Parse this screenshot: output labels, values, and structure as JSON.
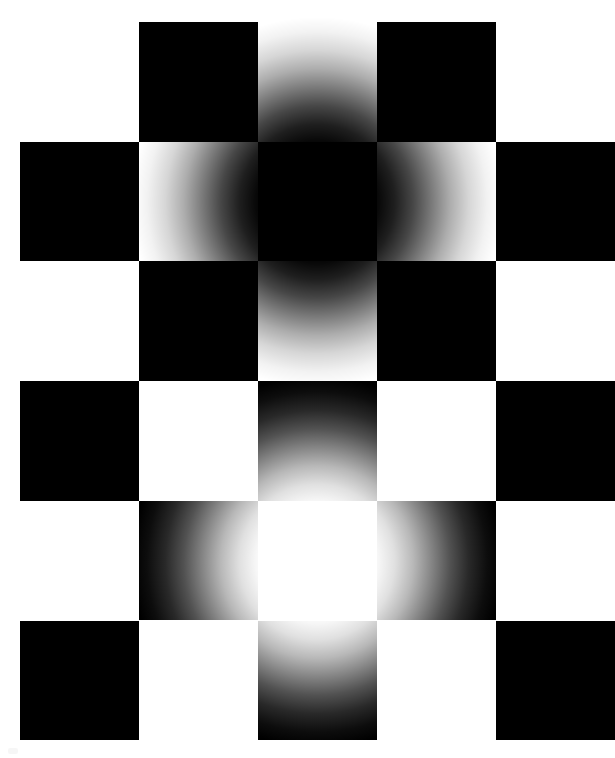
{
  "figure": {
    "name": "checkerboard-glow-illusion",
    "canvas": {
      "width": 615,
      "height": 758,
      "background": "#ffffff"
    }
  },
  "palette": {
    "square_dark": "#000000",
    "square_light": "#ffffff",
    "page_background": "#ffffff",
    "glow_dark_center": "#000000",
    "glow_light_center": "#ffffff"
  },
  "grid": {
    "origin_x": 20,
    "origin_y": 22,
    "columns": 5,
    "rows": 6,
    "cell_width": 119,
    "cell_height": 119.7,
    "pattern_note": "dark squares where (row + column) is even",
    "cells": [
      {
        "row": 0,
        "col": 0,
        "fill": "light"
      },
      {
        "row": 0,
        "col": 1,
        "fill": "dark"
      },
      {
        "row": 0,
        "col": 2,
        "fill": "light"
      },
      {
        "row": 0,
        "col": 3,
        "fill": "dark"
      },
      {
        "row": 0,
        "col": 4,
        "fill": "light"
      },
      {
        "row": 1,
        "col": 0,
        "fill": "dark"
      },
      {
        "row": 1,
        "col": 1,
        "fill": "light"
      },
      {
        "row": 1,
        "col": 2,
        "fill": "dark"
      },
      {
        "row": 1,
        "col": 3,
        "fill": "light"
      },
      {
        "row": 1,
        "col": 4,
        "fill": "dark"
      },
      {
        "row": 2,
        "col": 0,
        "fill": "light"
      },
      {
        "row": 2,
        "col": 1,
        "fill": "dark"
      },
      {
        "row": 2,
        "col": 2,
        "fill": "light"
      },
      {
        "row": 2,
        "col": 3,
        "fill": "dark"
      },
      {
        "row": 2,
        "col": 4,
        "fill": "light"
      },
      {
        "row": 3,
        "col": 0,
        "fill": "dark"
      },
      {
        "row": 3,
        "col": 1,
        "fill": "light"
      },
      {
        "row": 3,
        "col": 2,
        "fill": "dark"
      },
      {
        "row": 3,
        "col": 3,
        "fill": "light"
      },
      {
        "row": 3,
        "col": 4,
        "fill": "dark"
      },
      {
        "row": 4,
        "col": 0,
        "fill": "light"
      },
      {
        "row": 4,
        "col": 1,
        "fill": "dark"
      },
      {
        "row": 4,
        "col": 2,
        "fill": "light"
      },
      {
        "row": 4,
        "col": 3,
        "fill": "dark"
      },
      {
        "row": 4,
        "col": 4,
        "fill": "light"
      },
      {
        "row": 5,
        "col": 0,
        "fill": "dark"
      },
      {
        "row": 5,
        "col": 1,
        "fill": "light"
      },
      {
        "row": 5,
        "col": 2,
        "fill": "dark"
      },
      {
        "row": 5,
        "col": 3,
        "fill": "light"
      },
      {
        "row": 5,
        "col": 4,
        "fill": "dark"
      }
    ]
  },
  "glows": {
    "dark": {
      "name": "dark-radial-glow",
      "center_x": 317,
      "center_y": 202,
      "radius": 185,
      "color": "#000000",
      "blend": "multiply"
    },
    "light": {
      "name": "bright-radial-glow",
      "center_x": 317,
      "center_y": 562,
      "radius": 185,
      "color": "#ffffff",
      "blend": "screen"
    }
  },
  "artifacts": {
    "speck": {
      "x": 8,
      "y": 748,
      "note": "faint mark at lower-left of capture"
    }
  }
}
